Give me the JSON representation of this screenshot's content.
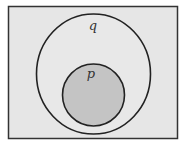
{
  "diagram": {
    "type": "venn",
    "universe": {
      "fill": "#e6e6e6",
      "stroke": "#333333"
    },
    "sets": [
      {
        "id": "q",
        "label": "q",
        "fill": "#e6e6e6",
        "stroke": "#222222"
      },
      {
        "id": "p",
        "label": "p",
        "fill": "#c4c4c4",
        "stroke": "#222222"
      }
    ]
  }
}
